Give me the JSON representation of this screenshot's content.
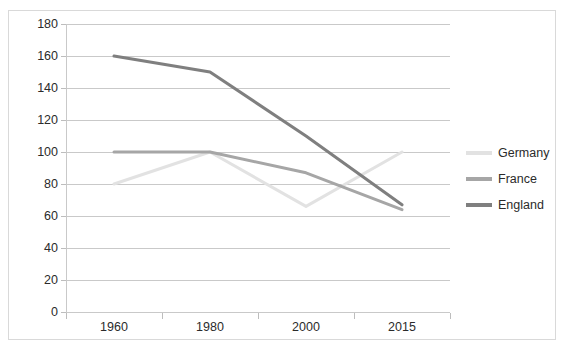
{
  "chart_data": {
    "type": "line",
    "title": "",
    "xlabel": "",
    "ylabel": "",
    "categories": [
      "1960",
      "1980",
      "2000",
      "2015"
    ],
    "yticks": [
      0,
      20,
      40,
      60,
      80,
      100,
      120,
      140,
      160,
      180
    ],
    "ylim": [
      0,
      180
    ],
    "grid": true,
    "legend_position": "right",
    "series": [
      {
        "name": "Germany",
        "color": "#E2E2E2",
        "values": [
          80,
          100,
          66,
          100
        ]
      },
      {
        "name": "France",
        "color": "#A6A6A6",
        "values": [
          100,
          100,
          87,
          64
        ]
      },
      {
        "name": "England",
        "color": "#7F7F7F",
        "values": [
          160,
          150,
          110,
          67
        ]
      }
    ]
  },
  "axes": {
    "y_tick_labels": [
      "180",
      "160",
      "140",
      "120",
      "100",
      "80",
      "60",
      "40",
      "20",
      "0"
    ],
    "x_tick_labels": [
      "1960",
      "1980",
      "2000",
      "2015"
    ]
  },
  "legend": {
    "items": [
      {
        "label": "Germany",
        "color": "#E2E2E2"
      },
      {
        "label": "France",
        "color": "#A6A6A6"
      },
      {
        "label": "England",
        "color": "#7F7F7F"
      }
    ]
  }
}
